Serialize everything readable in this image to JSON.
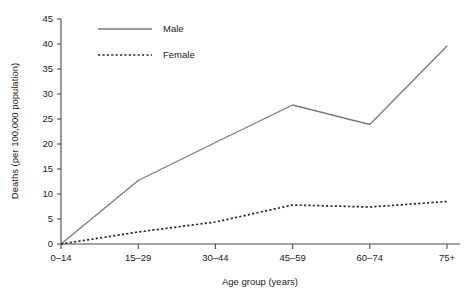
{
  "chart_data": {
    "type": "line",
    "title": "",
    "xlabel": "Age group (years)",
    "ylabel": "Deaths (per 100,000 population)",
    "categories": [
      "0–14",
      "15–29",
      "30–44",
      "45–59",
      "60–74",
      "75+"
    ],
    "ylim": [
      0,
      45
    ],
    "yticks": [
      0,
      5,
      10,
      15,
      20,
      25,
      30,
      35,
      40,
      45
    ],
    "ytick_labels": [
      "0",
      "5",
      "10",
      "15",
      "20",
      "25",
      "30",
      "35",
      "40",
      "45"
    ],
    "grid": false,
    "legend_position": "top-left-inside",
    "series": [
      {
        "name": "Male",
        "style": "solid",
        "color": "#7a7a7a",
        "values": [
          0,
          12.7,
          20.3,
          27.8,
          23.9,
          39.6
        ]
      },
      {
        "name": "Female",
        "style": "dotted",
        "color": "#2a2a2a",
        "values": [
          0,
          2.4,
          4.4,
          7.8,
          7.4,
          8.5
        ]
      }
    ]
  },
  "legend": {
    "items": [
      {
        "label": "Male"
      },
      {
        "label": "Female"
      }
    ]
  },
  "axes": {
    "x_title": "Age group (years)",
    "y_title": "Deaths (per 100,000 population)"
  }
}
